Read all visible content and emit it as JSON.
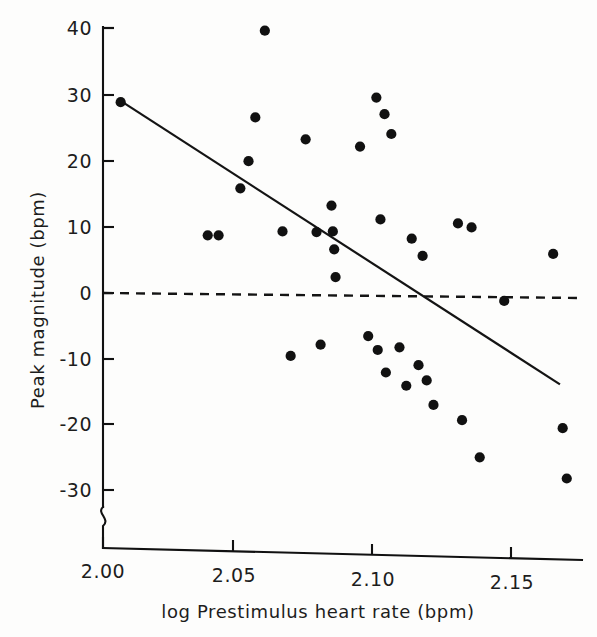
{
  "figure": {
    "background_color": "#fdfdfc",
    "ink_color": "#111111"
  },
  "chart_data": {
    "type": "scatter",
    "title": "",
    "xlabel": "log Prestimulus heart rate (bpm)",
    "ylabel": "Peak magnitude (bpm)",
    "xlim": [
      1.995,
      2.178
    ],
    "ylim": [
      -33,
      42
    ],
    "xticks": [
      2.0,
      2.05,
      2.1,
      2.15
    ],
    "xtick_labels": [
      "2.00",
      "2.05",
      "2.10",
      "2.15"
    ],
    "yticks": [
      40,
      30,
      20,
      10,
      0,
      -10,
      -20,
      -30
    ],
    "ytick_labels": [
      "40",
      "30",
      "20",
      "10",
      "0",
      "-10",
      "-20",
      "-30"
    ],
    "grid": false,
    "legend": null,
    "y_axis_break": true,
    "y_axis_break_note": "squiggle break below -30",
    "points": [
      {
        "x": 2.0065,
        "y": 28.8
      },
      {
        "x": 2.0385,
        "y": 8.7
      },
      {
        "x": 2.0425,
        "y": 8.7
      },
      {
        "x": 2.0505,
        "y": 15.8
      },
      {
        "x": 2.0535,
        "y": 19.9
      },
      {
        "x": 2.056,
        "y": 26.5
      },
      {
        "x": 2.0595,
        "y": 39.6
      },
      {
        "x": 2.066,
        "y": 9.3
      },
      {
        "x": 2.069,
        "y": -9.5
      },
      {
        "x": 2.0745,
        "y": 23.2
      },
      {
        "x": 2.0785,
        "y": 9.2
      },
      {
        "x": 2.08,
        "y": -7.8
      },
      {
        "x": 2.084,
        "y": 13.2
      },
      {
        "x": 2.0845,
        "y": 9.3
      },
      {
        "x": 2.085,
        "y": 6.6
      },
      {
        "x": 2.0855,
        "y": 2.4
      },
      {
        "x": 2.0945,
        "y": 22.1
      },
      {
        "x": 2.0975,
        "y": -6.5
      },
      {
        "x": 2.1005,
        "y": 29.5
      },
      {
        "x": 2.101,
        "y": -8.6
      },
      {
        "x": 2.102,
        "y": 11.1
      },
      {
        "x": 2.1035,
        "y": 27.0
      },
      {
        "x": 2.104,
        "y": -12.0
      },
      {
        "x": 2.106,
        "y": 24.0
      },
      {
        "x": 2.109,
        "y": -8.2
      },
      {
        "x": 2.1115,
        "y": -14.0
      },
      {
        "x": 2.1135,
        "y": 8.2
      },
      {
        "x": 2.116,
        "y": -10.9
      },
      {
        "x": 2.1175,
        "y": 5.6
      },
      {
        "x": 2.119,
        "y": -13.2
      },
      {
        "x": 2.1215,
        "y": -16.9
      },
      {
        "x": 2.1305,
        "y": 10.5
      },
      {
        "x": 2.132,
        "y": -19.2
      },
      {
        "x": 2.1355,
        "y": 9.9
      },
      {
        "x": 2.1385,
        "y": -24.8
      },
      {
        "x": 2.1475,
        "y": -1.2
      },
      {
        "x": 2.1655,
        "y": 5.9
      },
      {
        "x": 2.169,
        "y": -20.4
      },
      {
        "x": 2.1705,
        "y": -28.0
      }
    ],
    "regression_line": {
      "label": "least-squares fit",
      "style": "solid",
      "x_start": 2.0065,
      "y_start": 29.0,
      "x_end": 2.168,
      "y_end": -13.8
    },
    "reference_line": {
      "label": "zero reference",
      "style": "dashed",
      "y": 0
    }
  }
}
